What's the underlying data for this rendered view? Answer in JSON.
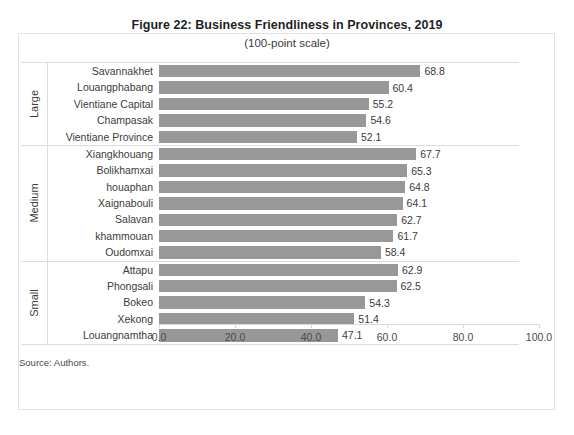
{
  "chart_data": {
    "type": "bar",
    "orientation": "horizontal",
    "title": "Figure 22: Business Friendliness in Provinces, 2019",
    "subtitle": "(100-point scale)",
    "xlabel": "",
    "ylabel": "",
    "xlim": [
      0.0,
      100.0
    ],
    "xticks": [
      "0.0",
      "20.0",
      "40.0",
      "60.0",
      "80.0",
      "100.0"
    ],
    "xtick_values": [
      0,
      20,
      40,
      60,
      80,
      100
    ],
    "grid": false,
    "legend": null,
    "bar_color": "#989898",
    "source_note": "Source: Authors.",
    "groups": [
      {
        "name": "Large",
        "categories": [
          "Savannakhet",
          "Louangphabang",
          "Vientiane Capital",
          "Champasak",
          "Vientiane Province"
        ],
        "values": [
          68.8,
          60.4,
          55.2,
          54.6,
          52.1
        ]
      },
      {
        "name": "Medium",
        "categories": [
          "Xiangkhouang",
          "Bolikhamxai",
          "houaphan",
          "Xaignabouli",
          "Salavan",
          "khammouan",
          "Oudomxai"
        ],
        "values": [
          67.7,
          65.3,
          64.8,
          64.1,
          62.7,
          61.7,
          58.4
        ]
      },
      {
        "name": "Small",
        "categories": [
          "Attapu",
          "Phongsali",
          "Bokeo",
          "Xekong",
          "Louangnamtha"
        ],
        "values": [
          62.9,
          62.5,
          54.3,
          51.4,
          47.1
        ]
      }
    ]
  }
}
